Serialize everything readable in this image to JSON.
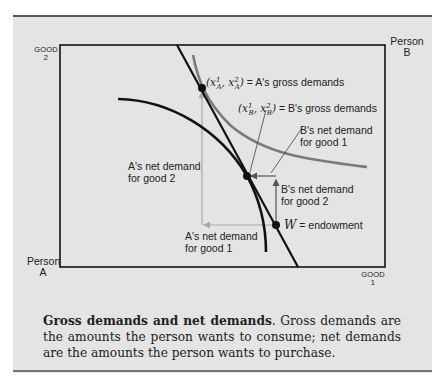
{
  "diagram": {
    "type": "edgeworth-box",
    "axes": {
      "y_label_top": "GOOD",
      "y_label_bottom": "2",
      "x_label_top": "GOOD",
      "x_label_bottom": "1"
    },
    "origins": {
      "person_a": {
        "line1": "Person",
        "line2": "A"
      },
      "person_b": {
        "line1": "Person",
        "line2": "B"
      }
    },
    "labels": {
      "a_gross_math": "(x¹A, x²A)",
      "a_gross_text": "= A's gross demands",
      "b_gross_math": "(x¹B, x²B)",
      "b_gross_text": "= B's gross demands",
      "b_net_good1_line1": "B's net demand",
      "b_net_good1_line2": "for good 1",
      "b_net_good2_line1": "B's net demand",
      "b_net_good2_line2": "for good 2",
      "a_net_good2_line1": "A's net demand",
      "a_net_good2_line2": "for good 2",
      "a_net_good1_line1": "A's net demand",
      "a_net_good1_line2": "for good 1",
      "endowment_symbol": "W",
      "endowment_text": "= endowment"
    },
    "colors": {
      "panel_bg": "#e4e4e4",
      "black_curve": "#111111",
      "gray_curve": "#7a7a7a",
      "net_demand_arrow_a": "#a8a8a8",
      "net_demand_arrow_b": "#555555"
    },
    "points": {
      "a_gross": [
        202,
        88
      ],
      "b_gross": [
        247,
        176
      ],
      "endowment": [
        276,
        225
      ]
    }
  },
  "caption": {
    "title": "Gross demands and net demands",
    "body": ". Gross demands are the amounts the person wants to consume; net demands are the amounts the person wants to purchase."
  }
}
